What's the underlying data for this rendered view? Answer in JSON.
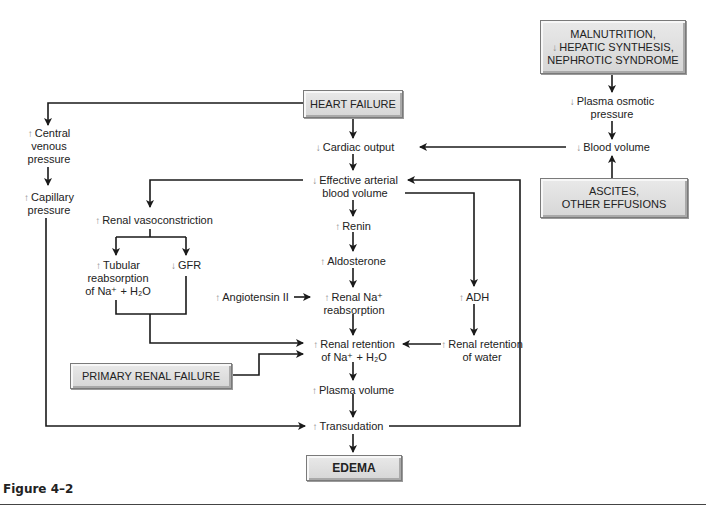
{
  "figure": {
    "caption": "Figure 4–2"
  },
  "symbols": {
    "up": "↑",
    "down": "↓"
  },
  "colors": {
    "box_fill": "#dcdcdc",
    "box_border": "#7a7a7a",
    "line": "#1a1a1a",
    "arrow_glyph": "#8a8a8a"
  },
  "boxes": {
    "heart_failure": "HEART FAILURE",
    "malnutrition": [
      "MALNUTRITION,",
      "HEPATIC SYNTHESIS,",
      "NEPHROTIC SYNDROME"
    ],
    "ascites": [
      "ASCITES,",
      "OTHER EFFUSIONS"
    ],
    "primary_renal_failure": "PRIMARY RENAL FAILURE",
    "edema": "EDEMA"
  },
  "nodes": {
    "central_venous_pressure": [
      "Central",
      "venous",
      "pressure"
    ],
    "capillary_pressure": [
      "Capillary",
      "pressure"
    ],
    "cardiac_output": "Cardiac output",
    "effective_arterial_blood_volume": [
      "Effective arterial",
      "blood volume"
    ],
    "plasma_osmotic_pressure": [
      "Plasma osmotic",
      "pressure"
    ],
    "blood_volume": "Blood volume",
    "renal_vasoconstriction": "Renal vasoconstriction",
    "tubular_reabsorption": [
      "Tubular",
      "reabsorption",
      "of Na⁺ + H₂O"
    ],
    "gfr": "GFR",
    "renin": "Renin",
    "aldosterone": "Aldosterone",
    "angiotensin_ii": "Angiotensin II",
    "renal_na_reabsorption": [
      "Renal Na⁺",
      "reabsorption"
    ],
    "adh": "ADH",
    "renal_retention_na_h2o": [
      "Renal retention",
      "of Na⁺ + H₂O"
    ],
    "renal_retention_water": [
      "Renal retention",
      "of water"
    ],
    "plasma_volume": "Plasma volume",
    "transudation": "Transudation"
  }
}
